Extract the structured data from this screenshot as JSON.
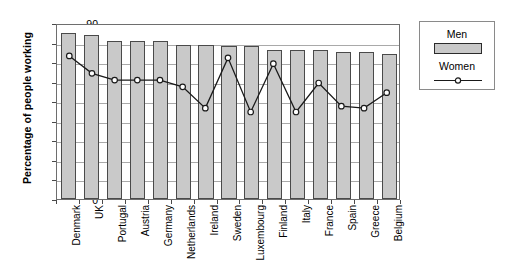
{
  "chart_data": {
    "type": "bar",
    "title": "",
    "xlabel": "",
    "ylabel": "Percentage of people working",
    "ylim": [
      0,
      90
    ],
    "ytick_step": 10,
    "yticks": [
      0,
      10,
      20,
      30,
      40,
      50,
      60,
      70,
      80,
      90
    ],
    "grid": true,
    "legend_position": "right",
    "categories": [
      "Denmark",
      "UK",
      "Portugal",
      "Austria",
      "Germany",
      "Netherlands",
      "Ireland",
      "Sweden",
      "Luxembourg",
      "Finland",
      "Italy",
      "France",
      "Spain",
      "Greece",
      "Belgium"
    ],
    "series": [
      {
        "name": "Men",
        "render": "bar",
        "color": "#c9c9c9",
        "border_color": "#4a4a4a",
        "values": [
          85,
          84,
          81,
          81,
          81,
          79,
          79,
          78.5,
          78,
          76,
          76,
          76,
          75,
          75,
          74
        ]
      },
      {
        "name": "Women",
        "render": "line",
        "color": "#1a1a1a",
        "marker": "circle-open",
        "values": [
          74,
          65,
          61.5,
          61.5,
          61.5,
          58,
          47,
          73,
          45,
          70,
          45,
          60,
          48,
          47,
          55
        ]
      }
    ]
  },
  "legend": {
    "men_label": "Men",
    "women_label": "Women"
  },
  "axis": {
    "y_title": "Percentage of people working"
  }
}
